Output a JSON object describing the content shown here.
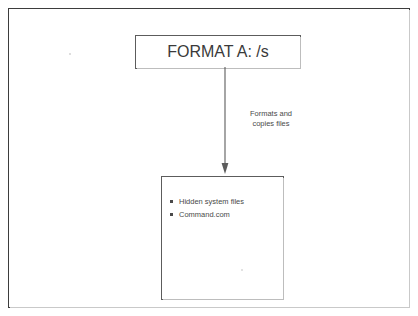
{
  "page": {
    "background_color": "#ffffff",
    "frame_color": "#3d3d3d"
  },
  "diagram": {
    "type": "flowchart",
    "orientation": "vertical-top-to-bottom",
    "command_box": {
      "label": "FORMAT A: /s"
    },
    "arrow": {
      "direction": "down",
      "annotation_lines": [
        "Formats and",
        "copies files"
      ]
    },
    "output_box": {
      "items": [
        "Hidden system files",
        "Command.com"
      ]
    }
  }
}
